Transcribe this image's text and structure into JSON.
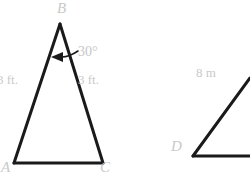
{
  "figure": {
    "stroke_color": "#1a1a1a",
    "label_color": "#c9c9c9",
    "background_color": "#ffffff",
    "triangle_abc": {
      "name": "triangle-abc",
      "vertices": {
        "B": "B",
        "A": "A",
        "C": "C"
      },
      "labels": {
        "left_leg": "3 ft.",
        "right_leg": "3 ft.",
        "apex_angle": "30°"
      }
    },
    "angle_d": {
      "name": "angle-d",
      "vertices": {
        "D": "D"
      },
      "labels": {
        "ray_length": "8 m"
      }
    }
  }
}
